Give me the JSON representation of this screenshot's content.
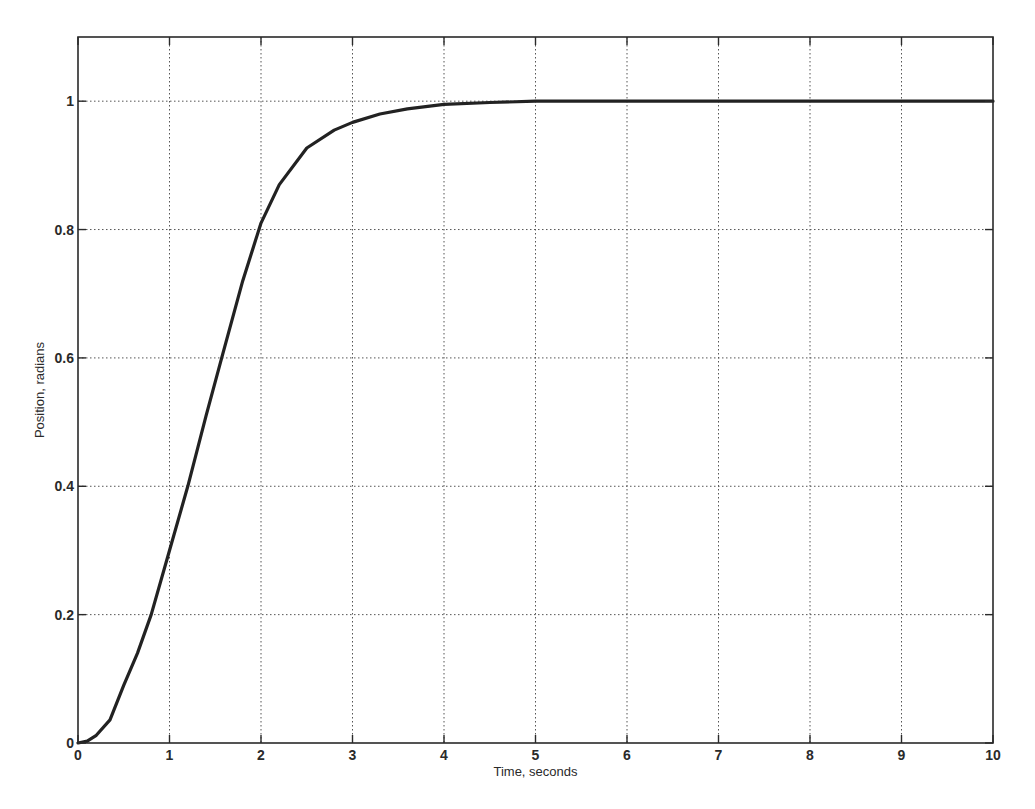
{
  "chart_data": {
    "type": "line",
    "title": "",
    "xlabel": "Time, seconds",
    "ylabel": "Position, radians",
    "xlim": [
      0,
      10
    ],
    "ylim": [
      0,
      1.1
    ],
    "grid": true,
    "legend": null,
    "x_ticks": [
      0,
      1,
      2,
      3,
      4,
      5,
      6,
      7,
      8,
      9,
      10
    ],
    "x_tick_labels": [
      "0",
      "1",
      "2",
      "3",
      "4",
      "5",
      "6",
      "7",
      "8",
      "9",
      "10"
    ],
    "y_ticks": [
      0,
      0.2,
      0.4,
      0.6,
      0.8,
      1.0
    ],
    "y_tick_labels": [
      "0",
      "0.2",
      "0.4",
      "0.6",
      "0.8",
      "1"
    ],
    "series": [
      {
        "name": "Position response",
        "color": "#222222",
        "x": [
          0,
          0.1,
          0.2,
          0.35,
          0.5,
          0.65,
          0.8,
          1.0,
          1.2,
          1.4,
          1.57,
          1.8,
          2.0,
          2.2,
          2.5,
          2.8,
          3.0,
          3.3,
          3.6,
          4.0,
          4.5,
          5.0,
          6.0,
          7.0,
          8.0,
          9.0,
          10.0
        ],
        "y": [
          0,
          0.003,
          0.012,
          0.036,
          0.09,
          0.14,
          0.2,
          0.3,
          0.4,
          0.51,
          0.6,
          0.72,
          0.81,
          0.87,
          0.927,
          0.955,
          0.967,
          0.98,
          0.988,
          0.995,
          0.998,
          1.0,
          1.0,
          1.0,
          1.0,
          1.0,
          1.0
        ]
      }
    ]
  },
  "plot_area": {
    "left": 78,
    "top": 37,
    "right": 993,
    "bottom": 743
  },
  "colors": {
    "axis": "#2a2a2a",
    "grid": "#555555",
    "line": "#222222",
    "background": "#ffffff"
  }
}
